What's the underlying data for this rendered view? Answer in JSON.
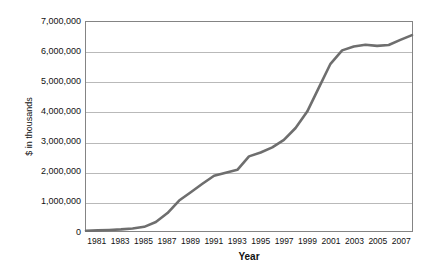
{
  "chart_data": {
    "type": "line",
    "title": "",
    "xlabel": "Year",
    "ylabel": "$ in thousands",
    "xlim": [
      1980,
      2008
    ],
    "ylim": [
      0,
      7000000
    ],
    "grid": true,
    "legend": false,
    "legend_position": "none",
    "line_color": "#6e6e6e",
    "gridline_color": "#b9b9b9",
    "frame_color": "#848484",
    "background_color": "#ffffff",
    "y_ticks": [
      0,
      1000000,
      2000000,
      3000000,
      4000000,
      5000000,
      6000000,
      7000000
    ],
    "y_tick_labels": [
      "0",
      "1,000,000",
      "2,000,000",
      "3,000,000",
      "4,000,000",
      "5,000,000",
      "6,000,000",
      "7,000,000"
    ],
    "x_ticks": [
      1981,
      1983,
      1985,
      1987,
      1989,
      1991,
      1993,
      1995,
      1997,
      1999,
      2001,
      2003,
      2005,
      2007
    ],
    "x_tick_labels": [
      "1981",
      "1983",
      "1985",
      "1987",
      "1989",
      "1991",
      "1993",
      "1995",
      "1997",
      "1999",
      "2001",
      "2003",
      "2005",
      "2007"
    ],
    "x": [
      1980,
      1981,
      1982,
      1983,
      1984,
      1985,
      1986,
      1987,
      1988,
      1989,
      1990,
      1991,
      1992,
      1993,
      1994,
      1995,
      1996,
      1997,
      1998,
      1999,
      2000,
      2001,
      2002,
      2003,
      2004,
      2005,
      2006,
      2007,
      2008
    ],
    "values": [
      10000,
      20000,
      35000,
      55000,
      85000,
      140000,
      300000,
      600000,
      1020000,
      1300000,
      1580000,
      1850000,
      1950000,
      2050000,
      2500000,
      2630000,
      2800000,
      3050000,
      3450000,
      4000000,
      4800000,
      5600000,
      6050000,
      6180000,
      6240000,
      6200000,
      6230000,
      6400000,
      6560000
    ],
    "series": [
      {
        "name": "Total",
        "values": [
          10000,
          20000,
          35000,
          55000,
          85000,
          140000,
          300000,
          600000,
          1020000,
          1300000,
          1580000,
          1850000,
          1950000,
          2050000,
          2500000,
          2630000,
          2800000,
          3050000,
          3450000,
          4000000,
          4800000,
          5600000,
          6050000,
          6180000,
          6240000,
          6200000,
          6230000,
          6400000,
          6560000
        ]
      }
    ]
  }
}
